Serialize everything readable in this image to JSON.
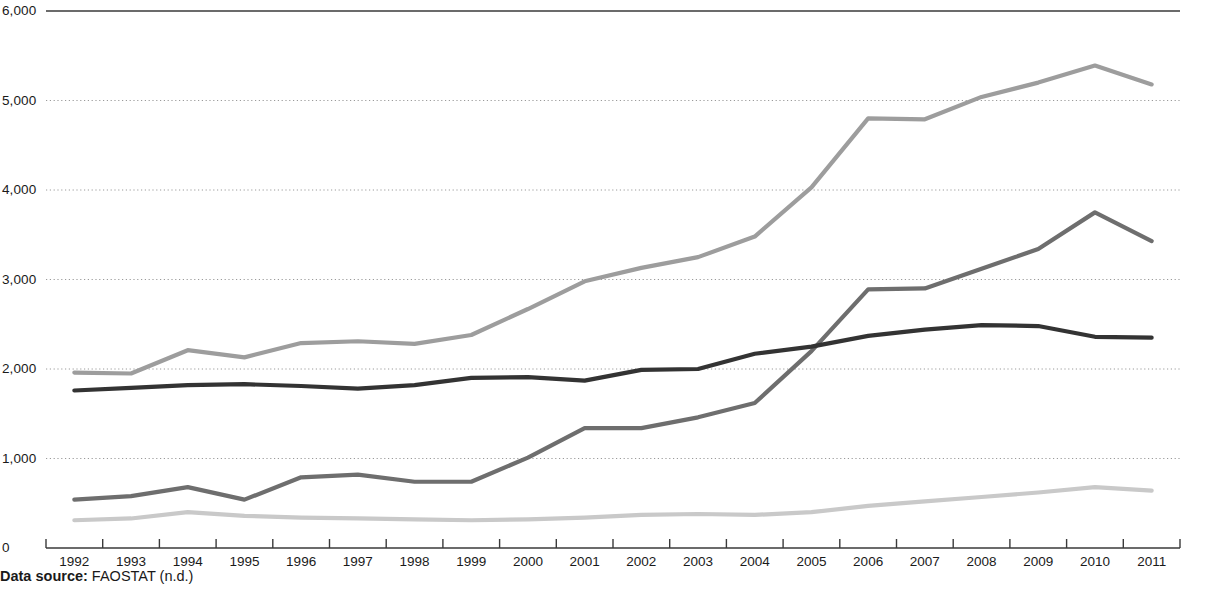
{
  "chart_data": {
    "type": "line",
    "title": "",
    "subtitle": "",
    "xlabel": "",
    "ylabel": "",
    "xlim": [
      1992,
      2011
    ],
    "ylim": [
      0,
      6000
    ],
    "grid": "horizontal-dotted",
    "legend": "none",
    "y_ticks": [
      "0",
      "1,000",
      "2,000",
      "3,000",
      "4,000",
      "5,000",
      "6,000"
    ],
    "y_tick_values": [
      0,
      1000,
      2000,
      3000,
      4000,
      5000,
      6000
    ],
    "categories": [
      "1992",
      "1993",
      "1994",
      "1995",
      "1996",
      "1997",
      "1998",
      "1999",
      "2000",
      "2001",
      "2002",
      "2003",
      "2004",
      "2005",
      "2006",
      "2007",
      "2008",
      "2009",
      "2010",
      "2011"
    ],
    "x": [
      1992,
      1993,
      1994,
      1995,
      1996,
      1997,
      1998,
      1999,
      2000,
      2001,
      2002,
      2003,
      2004,
      2005,
      2006,
      2007,
      2008,
      2009,
      2010,
      2011
    ],
    "series": [
      {
        "name": "series-1",
        "color": "#9d9d9d",
        "values": [
          1960,
          1950,
          2210,
          2130,
          2290,
          2310,
          2280,
          2380,
          2670,
          2980,
          3130,
          3250,
          3480,
          4030,
          4800,
          4790,
          5040,
          5200,
          5390,
          5180
        ]
      },
      {
        "name": "series-2",
        "color": "#6e6e6e",
        "values": [
          540,
          580,
          680,
          540,
          790,
          820,
          740,
          740,
          1010,
          1340,
          1340,
          1460,
          1620,
          2200,
          2890,
          2900,
          3120,
          3340,
          3750,
          3430
        ]
      },
      {
        "name": "series-3",
        "color": "#333333",
        "values": [
          1760,
          1790,
          1820,
          1830,
          1810,
          1780,
          1820,
          1900,
          1910,
          1870,
          1990,
          2000,
          2170,
          2250,
          2370,
          2440,
          2490,
          2480,
          2360,
          2350
        ]
      },
      {
        "name": "series-4",
        "color": "#c9c9c9",
        "values": [
          310,
          330,
          400,
          360,
          340,
          330,
          320,
          310,
          320,
          340,
          370,
          380,
          370,
          400,
          470,
          520,
          570,
          620,
          680,
          640
        ]
      }
    ],
    "colors": {
      "gridline": "#9a9a9a",
      "axis": "#3a3a3a",
      "text": "#1a1a1a"
    }
  },
  "footer": {
    "source_label": "Data source:",
    "source_value": " FAOSTAT (n.d.)"
  }
}
